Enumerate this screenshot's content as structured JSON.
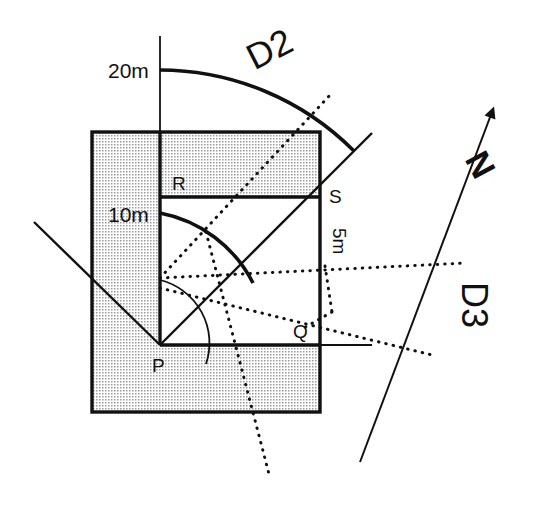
{
  "figure": {
    "title": "",
    "background_color": "#ffffff",
    "ink_color": "#111111",
    "hatch_fill_color": "#d9d9d9"
  },
  "labels": {
    "point_p": "P",
    "point_q": "Q",
    "point_r": "R",
    "point_s": "S",
    "radius_20": "20m",
    "radius_10": "10m",
    "radius_5": "5m",
    "direction_d2": "D2",
    "direction_d3": "D3",
    "north": "N"
  },
  "geometry": {
    "centre_point": {
      "name": "P",
      "x": 160,
      "y": 345
    },
    "arcs": [
      {
        "label": "5m",
        "radius_px": 65,
        "radius_m": 5
      },
      {
        "label": "10m",
        "radius_px": 132,
        "radius_m": 10
      },
      {
        "label": "20m",
        "radius_px": 275,
        "radius_m": 20
      }
    ],
    "shaded_outer_rect": {
      "x": 92,
      "y": 132,
      "width": 228,
      "height": 280
    },
    "white_notch": {
      "x": 160,
      "y": 197,
      "width": 160,
      "height": 148
    },
    "upper_band_divider_y": 197,
    "lower_band_divider_y": 345,
    "vertical_divider_x": 160
  },
  "annotations": {
    "d2_rotation_deg": -27,
    "d3_rotation_deg": 90,
    "north_rotation_deg": 62,
    "five_m_rotation_deg": 90
  }
}
